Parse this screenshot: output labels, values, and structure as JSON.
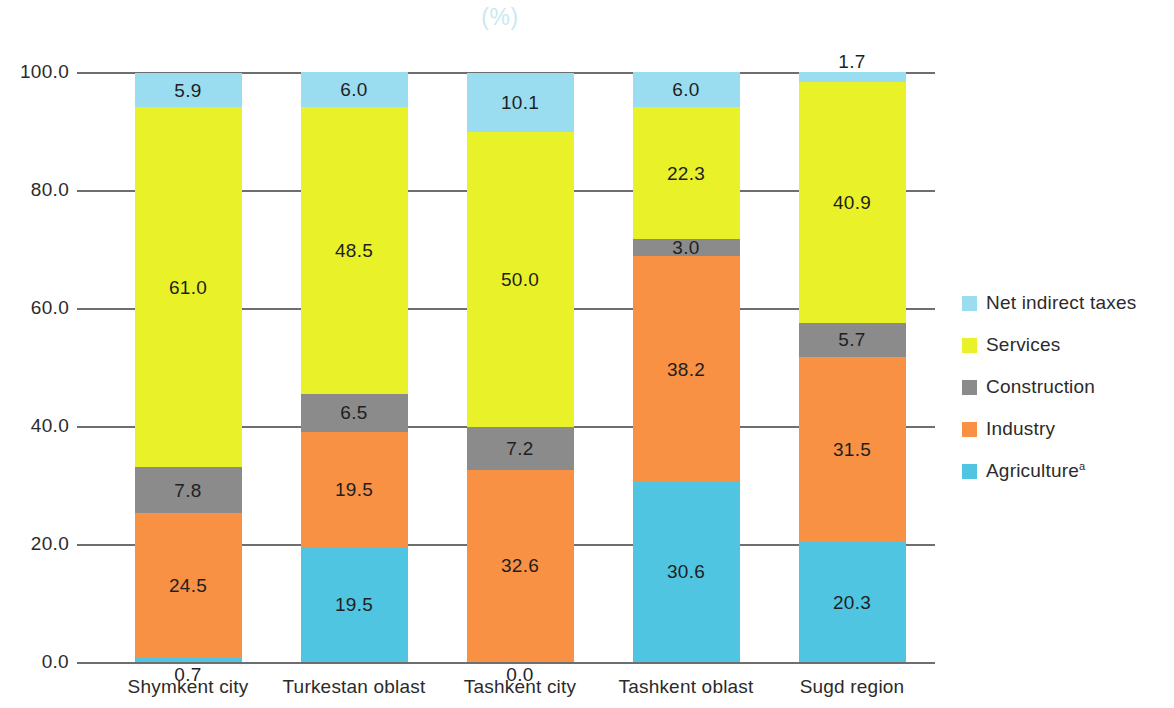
{
  "chart_data": {
    "type": "bar",
    "subtype": "stacked-percentage",
    "title": "(%)",
    "xlabel": "",
    "ylabel": "",
    "ylim": [
      0,
      100
    ],
    "ytick_labels": [
      "0.0",
      "20.0",
      "40.0",
      "60.0",
      "80.0",
      "100.0"
    ],
    "ytick_values": [
      0,
      20,
      40,
      60,
      80,
      100
    ],
    "grid": true,
    "legend_position": "right",
    "categories": [
      "Shymkent city",
      "Turkestan oblast",
      "Tashkent city",
      "Tashkent oblast",
      "Sugd region"
    ],
    "series": [
      {
        "name": "Agriculture",
        "superscript": "a",
        "color": "#4FC5E2",
        "values": [
          0.7,
          19.5,
          0.0,
          30.6,
          20.3
        ],
        "labels": [
          "0.7",
          "19.5",
          "0.0",
          "30.6",
          "20.3"
        ]
      },
      {
        "name": "Industry",
        "superscript": "",
        "color": "#F89144",
        "values": [
          24.5,
          19.5,
          32.6,
          38.2,
          31.5
        ],
        "labels": [
          "24.5",
          "19.5",
          "32.6",
          "38.2",
          "31.5"
        ]
      },
      {
        "name": "Construction",
        "superscript": "",
        "color": "#8B8B8B",
        "values": [
          7.8,
          6.5,
          7.2,
          3.0,
          5.7
        ],
        "labels": [
          "7.8",
          "6.5",
          "7.2",
          "3.0",
          "5.7"
        ]
      },
      {
        "name": "Services",
        "superscript": "",
        "color": "#E9F229",
        "values": [
          61.0,
          48.5,
          50.0,
          22.3,
          40.9
        ],
        "labels": [
          "61.0",
          "48.5",
          "50.0",
          "22.3",
          "40.9"
        ]
      },
      {
        "name": "Net indirect taxes",
        "superscript": "",
        "color": "#9BDDF0",
        "values": [
          5.9,
          6.0,
          10.1,
          6.0,
          1.7
        ],
        "labels": [
          "5.9",
          "6.0",
          "10.1",
          "6.0",
          "1.7"
        ]
      }
    ],
    "legend_entries": [
      {
        "label": "Net indirect taxes",
        "superscript": "",
        "color": "#9BDDF0"
      },
      {
        "label": "Services",
        "superscript": "",
        "color": "#E9F229"
      },
      {
        "label": "Construction",
        "superscript": "",
        "color": "#8B8B8B"
      },
      {
        "label": "Industry",
        "superscript": "",
        "color": "#F89144"
      },
      {
        "label": "Agriculture",
        "superscript": "a",
        "color": "#4FC5E2"
      }
    ]
  }
}
